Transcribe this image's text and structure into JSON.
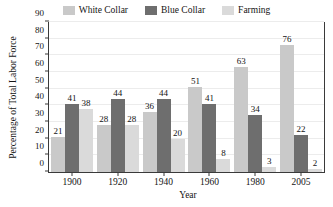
{
  "chart_data": {
    "type": "bar",
    "title": "",
    "xlabel": "Year",
    "ylabel": "Percentage of Total Labor Force",
    "categories": [
      "1900",
      "1920",
      "1940",
      "1960",
      "1980",
      "2005"
    ],
    "series": [
      {
        "name": "White Collar",
        "color": "#c9c9c9",
        "values": [
          21,
          28,
          36,
          51,
          63,
          76
        ]
      },
      {
        "name": "Blue Collar",
        "color": "#6e6e6e",
        "values": [
          41,
          44,
          44,
          41,
          34,
          22
        ]
      },
      {
        "name": "Farming",
        "color": "#dadada",
        "values": [
          38,
          28,
          20,
          8,
          3,
          2
        ]
      }
    ],
    "ylim": [
      0,
      90
    ],
    "yticks": [
      0,
      10,
      20,
      30,
      40,
      50,
      60,
      70,
      80,
      90
    ],
    "ytick_labels": [
      "0",
      "10",
      "20",
      "30",
      "40",
      "50",
      "60",
      "70",
      "80",
      "90"
    ],
    "grid": true,
    "grid_color": "#ececec",
    "legend_position": "top",
    "axis_color": "#3a3a3a",
    "background": "#ffffff",
    "data_labels": true
  },
  "legend": {
    "items": [
      {
        "label": "White Collar",
        "color": "#c9c9c9"
      },
      {
        "label": "Blue Collar",
        "color": "#6e6e6e"
      },
      {
        "label": "Farming",
        "color": "#dadada"
      }
    ]
  },
  "axes": {
    "x_title": "Year",
    "y_title": "Percentage of Total Labor Force"
  }
}
